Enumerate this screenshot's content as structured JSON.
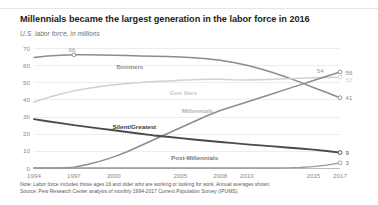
{
  "header": {
    "title": "Millennials became the largest generation in the labor force in 2016",
    "subtitle": "U.S. labor force, in millions"
  },
  "notes": {
    "note": "Note: Labor force includes those ages 16 and older who are working or looking for work. Annual averages shown.",
    "source": "Source: Pew Research Center analysis of monthly 1994-2017 Current Population Survey (IPUMS)."
  },
  "colors": {
    "boomers": "#8c8c8c",
    "gen_x": "#d0d0d0",
    "millennials": "#8c8c8c",
    "silent_greatest": "#4a4a4a",
    "post_millennials": "#9a9a9a",
    "grid": "#ededed",
    "axis": "#bdbdbd",
    "tick_text": "#8a8a8a"
  },
  "chart_data": {
    "type": "line",
    "title": "Millennials became the largest generation in the labor force in 2016",
    "xlabel": "",
    "ylabel": "U.S. labor force, in millions",
    "xlim": [
      1994,
      2017
    ],
    "ylim": [
      0,
      70
    ],
    "yticks": [
      0,
      10,
      20,
      30,
      40,
      50,
      60,
      70
    ],
    "xticks": [
      1994,
      1997,
      2000,
      2005,
      2008,
      2010,
      2015,
      2017
    ],
    "grid": true,
    "legend": "inline-labels",
    "x": [
      1994,
      1995,
      1996,
      1997,
      1998,
      1999,
      2000,
      2001,
      2002,
      2003,
      2004,
      2005,
      2006,
      2007,
      2008,
      2009,
      2010,
      2011,
      2012,
      2013,
      2014,
      2015,
      2016,
      2017
    ],
    "series": [
      {
        "name": "Boomers",
        "label": "Boomers",
        "end_value": 41,
        "peak_value": 66,
        "peak_year": 1997,
        "values": [
          64.5,
          65.3,
          65.8,
          66.0,
          66.0,
          65.9,
          65.8,
          65.6,
          65.4,
          65.2,
          65.0,
          64.7,
          64.3,
          63.7,
          62.9,
          61.6,
          59.9,
          57.9,
          55.6,
          52.9,
          50.1,
          47.0,
          44.0,
          41.0
        ]
      },
      {
        "name": "Gen Xers",
        "label": "Gen Xers",
        "end_value": 53,
        "values": [
          38.5,
          41.0,
          43.2,
          45.0,
          46.4,
          47.6,
          48.6,
          49.3,
          49.9,
          50.4,
          50.8,
          51.2,
          51.5,
          51.7,
          51.8,
          51.5,
          51.4,
          51.5,
          51.7,
          52.0,
          52.3,
          52.6,
          52.8,
          53.0
        ]
      },
      {
        "name": "Millennials",
        "label": "Millennials",
        "end_value": 56,
        "values": [
          0,
          0,
          0,
          0.5,
          2.0,
          4.0,
          6.5,
          9.5,
          13.0,
          16.5,
          20.0,
          23.5,
          27.0,
          30.5,
          33.5,
          36.0,
          38.5,
          41.0,
          43.5,
          46.0,
          48.5,
          51.0,
          53.5,
          56.0
        ]
      },
      {
        "name": "Silent/Greatest",
        "label": "Silent/Greatest",
        "end_value": 9,
        "values": [
          28.5,
          27.3,
          26.2,
          25.0,
          24.0,
          23.0,
          22.0,
          21.0,
          20.0,
          19.0,
          18.2,
          17.4,
          16.6,
          15.9,
          15.2,
          14.5,
          13.8,
          13.2,
          12.6,
          12.0,
          11.4,
          10.7,
          9.9,
          9.0
        ]
      },
      {
        "name": "Post-Millennials",
        "label": "Post-Millennials",
        "end_value": 3,
        "values": [
          0,
          0,
          0,
          0,
          0,
          0,
          0,
          0,
          0,
          0,
          0,
          0,
          0,
          0,
          0,
          0,
          0,
          0,
          0,
          0.1,
          0.3,
          0.8,
          1.7,
          3.0
        ]
      }
    ]
  }
}
